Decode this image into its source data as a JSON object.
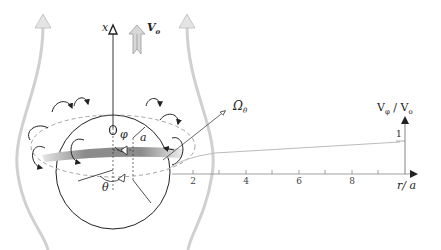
{
  "diagram": {
    "labels": {
      "x_axis": "x",
      "free_stream_velocity": "V",
      "free_stream_sub": "o",
      "rotation": "Ω",
      "rotation_sub": "θ",
      "azimuth_angle": "φ",
      "polar_angle": "θ",
      "radius": "a",
      "ratio_axis_v": "V",
      "ratio_axis_v_sub": "φ",
      "ratio_axis_sep": " / V",
      "ratio_axis_v0_sub": "o",
      "r_axis": "r/ a",
      "one_mark": "1"
    },
    "r_ticks": [
      "2",
      "4",
      "6",
      "8"
    ],
    "colors": {
      "line": "#222222",
      "gray_stream": "#c8c8c8",
      "ring_dark": "#7a7a7a",
      "ring_light": "#d8d8d8"
    }
  }
}
